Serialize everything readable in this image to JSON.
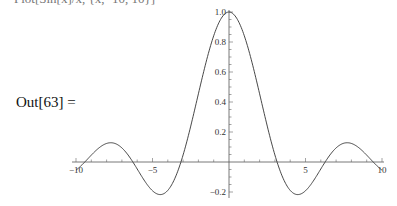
{
  "notebook": {
    "top_cut_text": "Plot[Sin[x]/x, {x, -10, 10}]",
    "output_label": "Out[63] ="
  },
  "chart_data": {
    "type": "line",
    "title": "",
    "xlabel": "",
    "ylabel": "",
    "function": "Sin[x]/x",
    "xlim": [
      -10,
      10
    ],
    "ylim": [
      -0.2,
      1.0
    ],
    "grid": false,
    "x_ticks": [
      -10,
      -5,
      5,
      10
    ],
    "x_tick_labels": [
      "-10",
      "-5",
      "5",
      "10"
    ],
    "y_ticks": [
      -0.2,
      0.2,
      0.4,
      0.6,
      0.8,
      1.0
    ],
    "y_tick_labels": [
      "-0.2",
      "0.2",
      "0.4",
      "0.6",
      "0.8",
      "1.0"
    ],
    "series": [
      {
        "name": "Sin[x]/x",
        "x": [
          -10,
          -9,
          -8,
          -7.725,
          -7,
          -6.283,
          -5,
          -4.493,
          -4,
          -3.142,
          -2,
          -1,
          0,
          1,
          2,
          3.142,
          4,
          4.493,
          5,
          6.283,
          7,
          7.725,
          8,
          9,
          10
        ],
        "y": [
          -0.054,
          0.046,
          0.124,
          0.128,
          0.094,
          0.0,
          -0.192,
          -0.217,
          -0.189,
          0.0,
          0.455,
          0.841,
          1.0,
          0.841,
          0.455,
          0.0,
          -0.189,
          -0.217,
          -0.192,
          0.0,
          0.094,
          0.128,
          0.124,
          0.046,
          -0.054
        ]
      }
    ]
  }
}
